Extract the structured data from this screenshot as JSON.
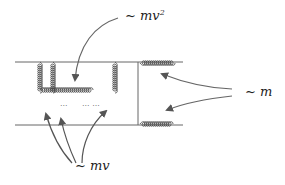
{
  "diagram": {
    "type": "feynman-diagram",
    "labels": {
      "soft": "~ mv",
      "ultrasoft_base": "~ mv",
      "ultrasoft_exp": "2",
      "hard": "~ m"
    },
    "dots": [
      "···",
      "··· ···"
    ],
    "colors": {
      "line": "#555555",
      "gluon": "#444444",
      "arrow": "#555555",
      "text": "#222222"
    }
  }
}
